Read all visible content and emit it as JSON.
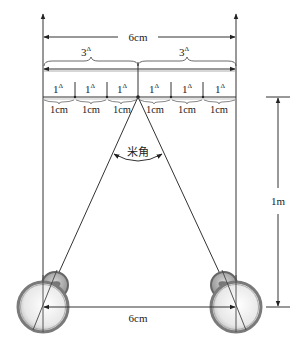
{
  "diagram": {
    "title_distance": "6cm",
    "half_prism_labels": [
      "3",
      "3"
    ],
    "prism_symbol": "Δ",
    "unit_prism_labels": [
      "1",
      "1",
      "1",
      "1",
      "1",
      "1"
    ],
    "unit_cm_labels": [
      "1cm",
      "1cm",
      "1cm",
      "1cm",
      "1cm",
      "1cm"
    ],
    "angle_label": "米角",
    "vertical_distance": "1m",
    "pupil_distance": "6cm"
  },
  "colors": {
    "line": "#333333",
    "eye_outer": "#7a7a7a",
    "eye_fill": "#f2f2f2"
  }
}
